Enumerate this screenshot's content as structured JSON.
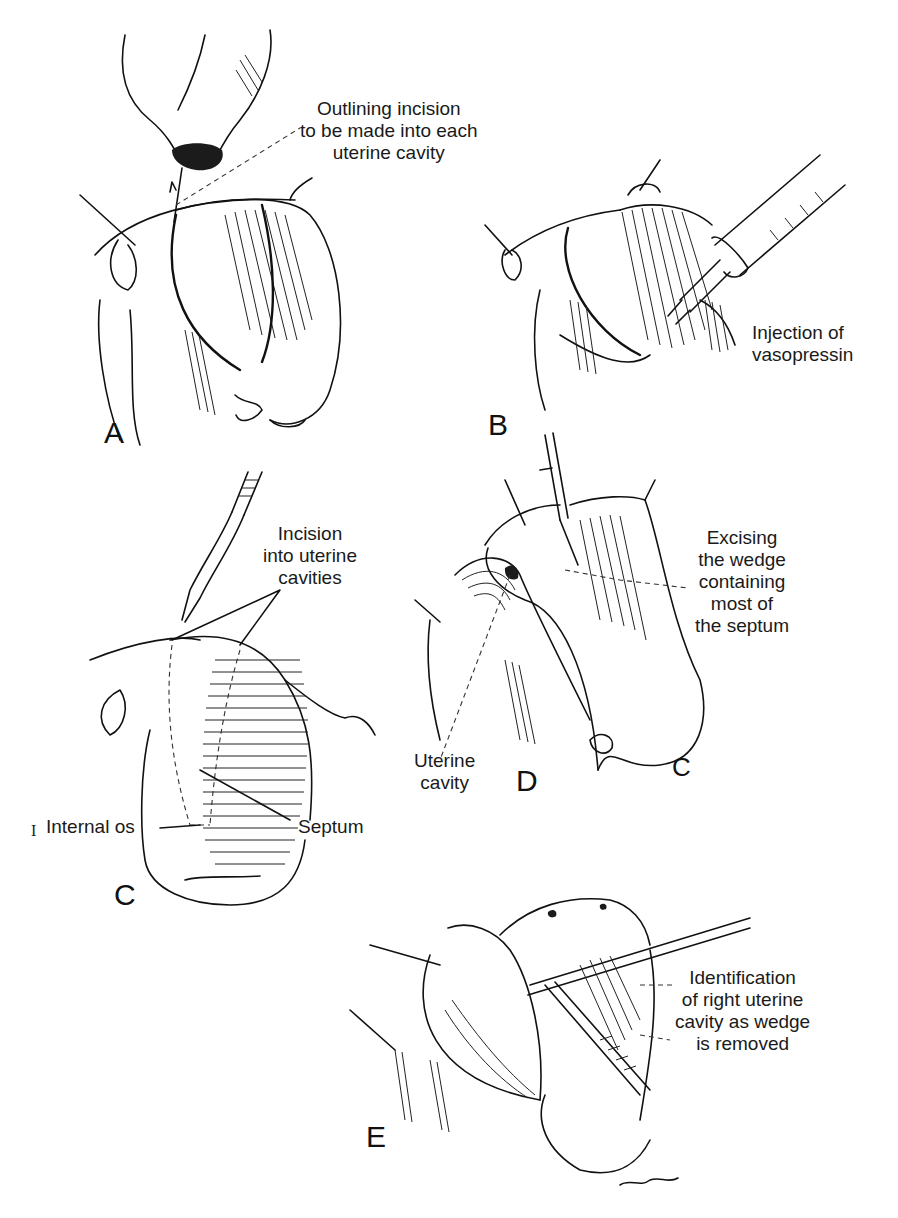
{
  "figure": {
    "panels": [
      {
        "letter": "A",
        "callouts": [
          {
            "lines": [
              "Outlining incision",
              "to be made into each",
              "uterine cavity"
            ]
          }
        ]
      },
      {
        "letter": "B",
        "callouts": [
          {
            "lines": [
              "Injection of",
              "vasopressin"
            ]
          }
        ]
      },
      {
        "letter": "C",
        "callouts": [
          {
            "lines": [
              "Incision",
              "into uterine",
              "cavities"
            ]
          },
          {
            "lines": [
              "Septum"
            ]
          },
          {
            "lines": [
              "Internal os"
            ]
          }
        ],
        "margin_mark": "I"
      },
      {
        "letter": "D",
        "callouts": [
          {
            "lines": [
              "Excising",
              "the wedge",
              "containing",
              "most of",
              "the septum"
            ]
          },
          {
            "lines": [
              "Uterine",
              "cavity"
            ]
          }
        ],
        "inner_mark": "C"
      },
      {
        "letter": "E",
        "callouts": [
          {
            "lines": [
              "Identification",
              "of right uterine",
              "cavity as wedge",
              "is removed"
            ]
          }
        ]
      }
    ]
  }
}
